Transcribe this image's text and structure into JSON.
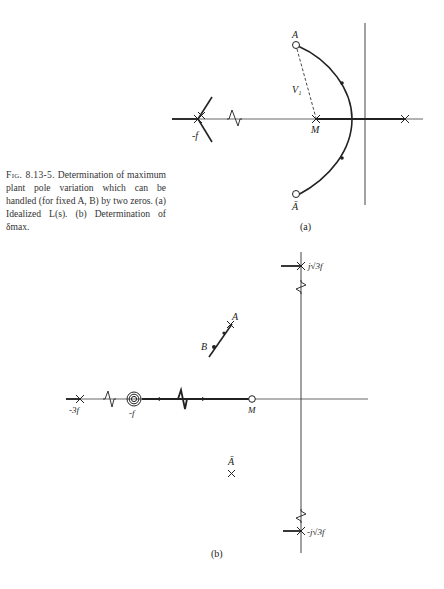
{
  "caption": {
    "figure_label": "Fig. 8.13-5.",
    "text": "Determination of maximum plant pole variation which can be handled (for fixed A, B) by two zeros. (a) Idealized L(s). (b) Determination of δmax."
  },
  "panel_a": {
    "label": "(a)",
    "points": {
      "zero_A": "A",
      "zero_A_bar": "Ā",
      "pole_M": "M",
      "pole_minus_f": "-f",
      "vector": "V₁"
    }
  },
  "panel_b": {
    "label": "(b)",
    "points": {
      "zero_A": "A",
      "pole_B": "B",
      "zero_A_bar": "Ā",
      "pole_M": "M",
      "multi_pole": "-f",
      "pole_minus_3f": "-3f",
      "pole_upper": "j√3f",
      "pole_lower": "-j√3f"
    }
  }
}
